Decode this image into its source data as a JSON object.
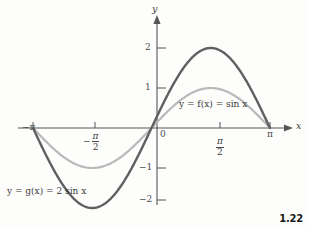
{
  "figure": {
    "number": "1.22",
    "background_color": "#fdfdfc"
  },
  "axes": {
    "x_axis_name": "x",
    "y_axis_name": "y",
    "origin_label": "0",
    "axis_color": "#555555"
  },
  "x_ticks": [
    {
      "label": "−π",
      "value": -3.14159,
      "kind": "plain"
    },
    {
      "label": "−π/2",
      "value": -1.5708,
      "kind": "fraction",
      "sign": "−",
      "numerator": "π",
      "denominator": "2"
    },
    {
      "label": "π/2",
      "value": 1.5708,
      "kind": "fraction",
      "sign": "",
      "numerator": "π",
      "denominator": "2"
    },
    {
      "label": "π",
      "value": 3.14159,
      "kind": "plain"
    }
  ],
  "y_ticks": [
    {
      "label": "2",
      "value": 2
    },
    {
      "label": "1",
      "value": 1
    },
    {
      "label": "−1",
      "value": -1
    },
    {
      "label": "−2",
      "value": -2
    }
  ],
  "curve_labels": {
    "f": {
      "text": "y = f(x) = sin x",
      "color": "#9a9a9a"
    },
    "g": {
      "text": "y = g(x) = 2 sin x",
      "color": "#555555"
    }
  },
  "chart_data": {
    "type": "line",
    "title": "",
    "subtitle": "",
    "xlabel": "x",
    "ylabel": "y",
    "xlim": [
      -3.6,
      3.9
    ],
    "ylim": [
      -2.45,
      2.45
    ],
    "grid": false,
    "legend": "inline-annotations",
    "x_tick_labels": [
      "−π",
      "−π/2",
      "0",
      "π/2",
      "π"
    ],
    "x_tick_values": [
      -3.14159,
      -1.5708,
      0,
      1.5708,
      3.14159
    ],
    "y_tick_labels": [
      "2",
      "1",
      "−1",
      "−2"
    ],
    "y_tick_values": [
      2,
      1,
      -1,
      -2
    ],
    "annotations": [
      {
        "text": "y = f(x) = sin x",
        "x": 1.0,
        "y": 0.62
      },
      {
        "text": "y = g(x) = 2 sin x",
        "x": -3.2,
        "y": -1.68
      }
    ],
    "series": [
      {
        "name": "y = f(x) = sin x",
        "color": "#b9b9b9",
        "amplitude": 1,
        "formula": "sin(x)",
        "x": [
          -3.14159,
          -2.74889,
          -2.35619,
          -1.9635,
          -1.5708,
          -1.1781,
          -0.7854,
          -0.3927,
          0,
          0.3927,
          0.7854,
          1.1781,
          1.5708,
          1.9635,
          2.35619,
          2.74889,
          3.14159
        ],
        "values": [
          0,
          -0.38268,
          -0.70711,
          -0.92388,
          -1,
          -0.92388,
          -0.70711,
          -0.38268,
          0,
          0.38268,
          0.70711,
          0.92388,
          1,
          0.92388,
          0.70711,
          0.38268,
          0
        ]
      },
      {
        "name": "y = g(x) = 2 sin x",
        "color": "#606060",
        "amplitude": 2,
        "formula": "2*sin(x)",
        "x": [
          -3.14159,
          -2.74889,
          -2.35619,
          -1.9635,
          -1.5708,
          -1.1781,
          -0.7854,
          -0.3927,
          0,
          0.3927,
          0.7854,
          1.1781,
          1.5708,
          1.9635,
          2.35619,
          2.74889,
          3.14159
        ],
        "values": [
          0,
          -0.76537,
          -1.41421,
          -1.84776,
          -2,
          -1.84776,
          -1.41421,
          -0.76537,
          0,
          0.76537,
          1.41421,
          1.84776,
          2,
          1.84776,
          1.41421,
          0.76537,
          0
        ]
      }
    ]
  }
}
